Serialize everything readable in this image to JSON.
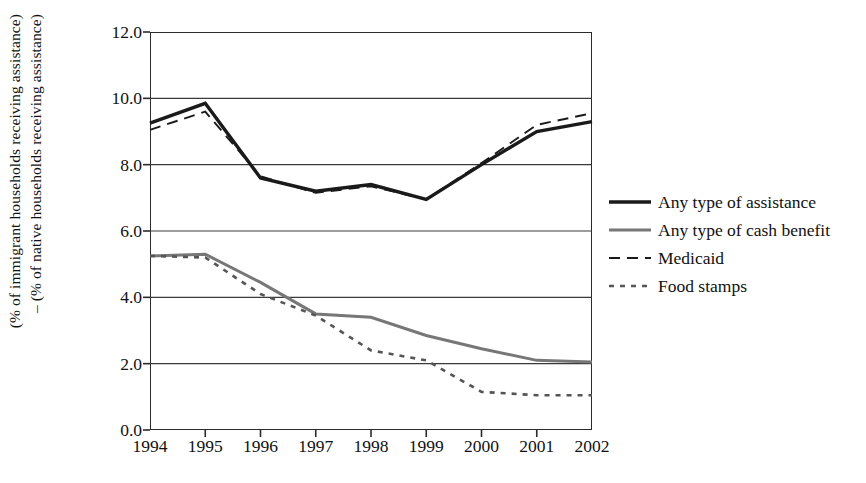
{
  "chart_data": {
    "type": "line",
    "title": "",
    "xlabel": "",
    "ylabel": "(% of immigrant households receiving assistance) – (% of native households receiving assistance)",
    "ylabel_line1": "(% of immigrant households receiving assistance)",
    "ylabel_line2": "– (% of native households receiving assistance)",
    "categories": [
      "1994",
      "1995",
      "1996",
      "1997",
      "1998",
      "1999",
      "2000",
      "2001",
      "2002"
    ],
    "x": [
      1994,
      1995,
      1996,
      1997,
      1998,
      1999,
      2000,
      2001,
      2002
    ],
    "ylim": [
      0.0,
      12.0
    ],
    "yticks": [
      "12.0",
      "10.0",
      "8.0",
      "6.0",
      "4.0",
      "2.0",
      "0.0"
    ],
    "ytick_values": [
      12.0,
      10.0,
      8.0,
      6.0,
      4.0,
      2.0,
      0.0
    ],
    "grid": true,
    "grid_axis": "y",
    "legend_position": "right",
    "series": [
      {
        "name": "Any type of assistance",
        "style": "solid-thick",
        "color": "#1a1a1a",
        "values": [
          9.25,
          9.85,
          7.6,
          7.2,
          7.4,
          6.95,
          8.0,
          9.0,
          9.3
        ]
      },
      {
        "name": "Any type of cash benefit",
        "style": "solid-gray",
        "color": "#777777",
        "values": [
          5.25,
          5.3,
          4.45,
          3.5,
          3.4,
          2.85,
          2.45,
          2.1,
          2.05
        ]
      },
      {
        "name": "Medicaid",
        "style": "dashed",
        "color": "#1a1a1a",
        "values": [
          9.05,
          9.6,
          7.65,
          7.15,
          7.35,
          6.95,
          8.05,
          9.2,
          9.55
        ]
      },
      {
        "name": "Food stamps",
        "style": "dotted",
        "color": "#555555",
        "values": [
          5.25,
          5.2,
          4.1,
          3.45,
          2.4,
          2.1,
          1.15,
          1.05,
          1.05
        ]
      }
    ]
  },
  "legend": {
    "items": [
      {
        "label": "Any type of assistance"
      },
      {
        "label": "Any type of cash benefit"
      },
      {
        "label": "Medicaid"
      },
      {
        "label": "Food stamps"
      }
    ]
  }
}
